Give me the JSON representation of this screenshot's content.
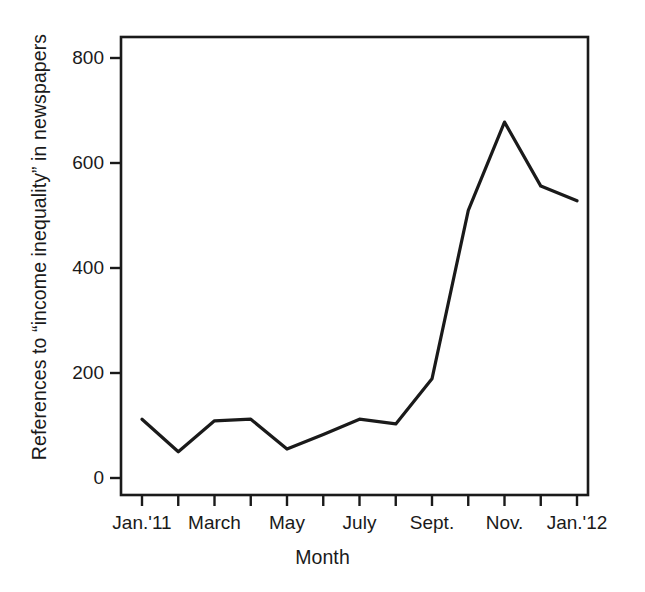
{
  "chart_data": {
    "type": "line",
    "title": "",
    "xlabel": "Month",
    "ylabel": "References to “income inequality” in newspapers",
    "categories": [
      "Jan.'11",
      "Feb.",
      "March",
      "April",
      "May",
      "June",
      "July",
      "Aug.",
      "Sept.",
      "Oct.",
      "Nov.",
      "Dec.",
      "Jan.'12"
    ],
    "values": [
      112,
      50,
      109,
      112,
      55,
      83,
      112,
      103,
      189,
      510,
      678,
      556,
      528
    ],
    "x_tick_labels": [
      "Jan.'11",
      "",
      "March",
      "",
      "May",
      "",
      "July",
      "",
      "Sept.",
      "",
      "Nov.",
      "",
      "Jan.'12"
    ],
    "y_tick_labels": [
      "0",
      "200",
      "400",
      "600",
      "800"
    ],
    "y_tick_values": [
      0,
      200,
      400,
      600,
      800
    ],
    "ylim": [
      0,
      830
    ],
    "grid": false,
    "legend": false,
    "line_color": "#1a1a1a",
    "axis_color": "#1a1a1a"
  },
  "axis_titles": {
    "x": "Month",
    "y": "References to “income inequality” in newspapers"
  }
}
